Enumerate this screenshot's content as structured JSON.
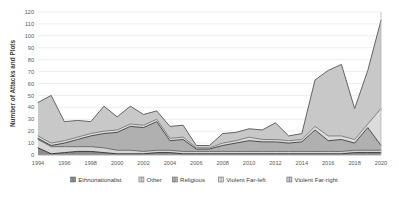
{
  "chart_data": {
    "type": "area",
    "stacked": true,
    "title": "",
    "subtitle": "",
    "xlabel": "",
    "ylabel": "Number of Attacks and Plots",
    "xlim": [
      1994,
      2020
    ],
    "ylim": [
      0,
      120
    ],
    "ytick_step": 10,
    "xtick_step": 2,
    "grid": true,
    "legend_position": "bottom",
    "x": [
      1994,
      1995,
      1996,
      1997,
      1998,
      1999,
      2000,
      2001,
      2002,
      2003,
      2004,
      2005,
      2006,
      2007,
      2008,
      2009,
      2010,
      2011,
      2012,
      2013,
      2014,
      2015,
      2016,
      2017,
      2018,
      2019,
      2020
    ],
    "xticks": [
      "1994",
      "1996",
      "1998",
      "2000",
      "2002",
      "2004",
      "2006",
      "2008",
      "2010",
      "2012",
      "2014",
      "2016",
      "2018",
      "2020"
    ],
    "yticks": [
      "0",
      "10",
      "20",
      "30",
      "40",
      "50",
      "60",
      "70",
      "80",
      "90",
      "100",
      "110",
      "120"
    ],
    "series": [
      {
        "name": "Ethnonationalist",
        "color": "#8c8c8c",
        "line_color": "#3a3a3a",
        "values": [
          6,
          1,
          2,
          3,
          3,
          2,
          1,
          1,
          1,
          2,
          2,
          1,
          1,
          1,
          1,
          1,
          1,
          1,
          1,
          1,
          1,
          1,
          1,
          1,
          2,
          2,
          2
        ]
      },
      {
        "name": "Other",
        "color": "#d6d6d6",
        "line_color": "#6e6e6e",
        "values": [
          7,
          6,
          5,
          4,
          4,
          4,
          3,
          3,
          2,
          2,
          2,
          2,
          2,
          2,
          2,
          2,
          2,
          2,
          2,
          2,
          2,
          2,
          2,
          2,
          2,
          2,
          2
        ]
      },
      {
        "name": "Religious",
        "color": "#b0b0b0",
        "line_color": "#4a4a4a",
        "values": [
          1,
          1,
          3,
          6,
          9,
          12,
          15,
          20,
          20,
          24,
          8,
          10,
          2,
          2,
          5,
          7,
          9,
          8,
          8,
          7,
          8,
          18,
          9,
          10,
          6,
          19,
          4
        ]
      },
      {
        "name": "Violent Far-left",
        "color": "#dcdcdc",
        "line_color": "#808080",
        "values": [
          2,
          2,
          2,
          2,
          2,
          2,
          2,
          2,
          2,
          2,
          2,
          2,
          1,
          1,
          2,
          2,
          3,
          2,
          2,
          2,
          2,
          3,
          4,
          3,
          3,
          3,
          31
        ]
      },
      {
        "name": "Violent Far-right",
        "color": "#c8c8c8",
        "line_color": "#636363",
        "values": [
          28,
          40,
          16,
          14,
          10,
          21,
          11,
          15,
          9,
          7,
          10,
          10,
          2,
          2,
          8,
          7,
          7,
          8,
          14,
          4,
          5,
          39,
          55,
          60,
          26,
          45,
          74
        ]
      }
    ],
    "legend": [
      "Ethnonationalist",
      "Other",
      "Religious",
      "Violent Far-left",
      "Violent Far-right"
    ]
  }
}
